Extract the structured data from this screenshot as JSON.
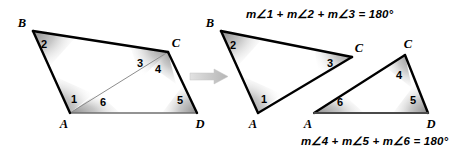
{
  "figure": {
    "equations": {
      "top": "m∠1 + m∠2 + m∠3 = 180°",
      "bottom": "m∠4 + m∠5 + m∠6 = 180°"
    },
    "colors": {
      "stroke_dark": "#000000",
      "stroke_light": "#808080",
      "shade_dark": "#8c8c8c",
      "shade_light": "#ffffff",
      "arrow": "#c9c9c9",
      "background": "#ffffff"
    },
    "arrow": {
      "name": "transform-arrow",
      "direction": "right",
      "x": 190,
      "y": 70,
      "width": 38,
      "height": 13
    },
    "left_figure": {
      "name": "quadrilateral-abcd",
      "vertices": [
        {
          "label": "B",
          "x": 33,
          "y": 31,
          "label_x": 22,
          "label_y": 27
        },
        {
          "label": "C",
          "x": 168,
          "y": 52,
          "label_x": 176,
          "label_y": 47
        },
        {
          "label": "D",
          "x": 197,
          "y": 113,
          "label_x": 200,
          "label_y": 124
        },
        {
          "label": "A",
          "x": 70,
          "y": 113,
          "label_x": 64,
          "label_y": 124
        }
      ],
      "angle_labels": [
        {
          "text": "1",
          "x": 74,
          "y": 98
        },
        {
          "text": "2",
          "x": 44,
          "y": 43
        },
        {
          "text": "3",
          "x": 140,
          "y": 62
        },
        {
          "text": "4",
          "x": 158,
          "y": 68
        },
        {
          "text": "5",
          "x": 180,
          "y": 99
        },
        {
          "text": "6",
          "x": 103,
          "y": 101
        }
      ]
    },
    "middle_figure": {
      "name": "triangle-abc",
      "vertices": [
        {
          "label": "B",
          "x": 221,
          "y": 31,
          "label_x": 210,
          "label_y": 27
        },
        {
          "label": "C",
          "x": 352,
          "y": 57,
          "label_x": 359,
          "label_y": 52
        },
        {
          "label": "A",
          "x": 258,
          "y": 113,
          "label_x": 253,
          "label_y": 124
        }
      ],
      "angle_labels": [
        {
          "text": "1",
          "x": 264,
          "y": 99
        },
        {
          "text": "2",
          "x": 233,
          "y": 44
        },
        {
          "text": "3",
          "x": 330,
          "y": 62
        }
      ]
    },
    "right_figure": {
      "name": "triangle-acd",
      "vertices": [
        {
          "label": "C",
          "x": 405,
          "y": 55,
          "label_x": 408,
          "label_y": 48
        },
        {
          "label": "D",
          "x": 428,
          "y": 113,
          "label_x": 431,
          "label_y": 124
        },
        {
          "label": "A",
          "x": 314,
          "y": 113,
          "label_x": 308,
          "label_y": 124
        }
      ],
      "angle_labels": [
        {
          "text": "4",
          "x": 399,
          "y": 74
        },
        {
          "text": "5",
          "x": 413,
          "y": 99
        },
        {
          "text": "6",
          "x": 340,
          "y": 101
        }
      ]
    }
  }
}
